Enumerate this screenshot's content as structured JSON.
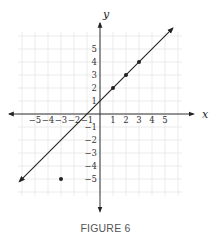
{
  "figure": {
    "caption": "FIGURE 6",
    "x_axis_label": "x",
    "y_axis_label": "y",
    "x_tick_labels": [
      "−5",
      "−4",
      "−3",
      "−2",
      "−1",
      "1",
      "2",
      "3",
      "4",
      "5"
    ],
    "y_tick_labels": [
      "5",
      "4",
      "3",
      "2",
      "1",
      "−1",
      "−2",
      "−3",
      "−4",
      "−5"
    ]
  },
  "chart_data": {
    "type": "scatter",
    "title": "FIGURE 6",
    "xlabel": "x",
    "ylabel": "y",
    "xlim": [
      -6,
      6
    ],
    "ylim": [
      -6,
      6
    ],
    "grid": true,
    "lines": [
      {
        "name": "y = x + 1",
        "slope": 1,
        "intercept": 1,
        "arrows": "both"
      }
    ],
    "points": [
      {
        "x": 1,
        "y": 2
      },
      {
        "x": 2,
        "y": 3
      },
      {
        "x": 3,
        "y": 4
      },
      {
        "x": -3,
        "y": -5
      }
    ],
    "x_ticks": [
      -5,
      -4,
      -3,
      -2,
      -1,
      1,
      2,
      3,
      4,
      5
    ],
    "y_ticks": [
      -5,
      -4,
      -3,
      -2,
      -1,
      1,
      2,
      3,
      4,
      5
    ]
  }
}
